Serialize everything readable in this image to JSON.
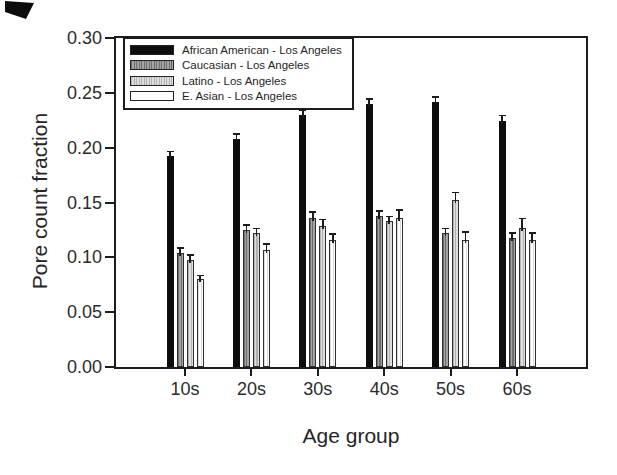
{
  "figure": {
    "background_color": "#ffffff",
    "ink_color": "#1c1c1c",
    "scan_artifact_top_left": true
  },
  "chart_data": {
    "type": "bar",
    "title": "",
    "xlabel": "Age group",
    "ylabel": "Pore count fraction",
    "ylim": [
      0,
      0.3
    ],
    "yticks": [
      0.0,
      0.05,
      0.1,
      0.15,
      0.2,
      0.25,
      0.3
    ],
    "ytick_labels": [
      "0.00",
      "0.05",
      "0.10",
      "0.15",
      "0.20",
      "0.25",
      "0.30"
    ],
    "categories": [
      "10s",
      "20s",
      "30s",
      "40s",
      "50s",
      "60s"
    ],
    "grid": false,
    "legend_position": "top-left",
    "error_bars": "upper",
    "series": [
      {
        "name": "African American - Los Angeles",
        "swatch": "solid-black",
        "color": "#0d0d0d",
        "values": [
          0.192,
          0.208,
          0.23,
          0.24,
          0.242,
          0.224
        ],
        "errors": [
          0.005,
          0.005,
          0.005,
          0.005,
          0.005,
          0.006
        ]
      },
      {
        "name": "Caucasian - Los Angeles",
        "swatch": "hatched-dark-gray",
        "color": "#9a9a9a",
        "values": [
          0.104,
          0.125,
          0.136,
          0.138,
          0.122,
          0.118
        ],
        "errors": [
          0.005,
          0.005,
          0.006,
          0.005,
          0.005,
          0.005
        ]
      },
      {
        "name": "Latino - Los Angeles",
        "swatch": "hatched-light-gray",
        "color": "#d4d4d4",
        "values": [
          0.098,
          0.122,
          0.129,
          0.133,
          0.152,
          0.127
        ],
        "errors": [
          0.005,
          0.005,
          0.006,
          0.005,
          0.008,
          0.009
        ]
      },
      {
        "name": "E. Asian - Los Angeles",
        "swatch": "white",
        "color": "#ffffff",
        "values": [
          0.08,
          0.107,
          0.116,
          0.136,
          0.116,
          0.116
        ],
        "errors": [
          0.004,
          0.006,
          0.006,
          0.008,
          0.008,
          0.007
        ]
      }
    ]
  }
}
